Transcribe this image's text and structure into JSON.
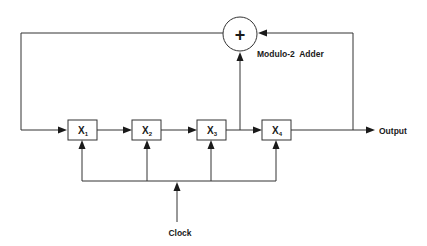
{
  "diagram": {
    "type": "linear feedback shift register",
    "registers": [
      {
        "id": "x1",
        "label": "X",
        "sub": "1"
      },
      {
        "id": "x2",
        "label": "X",
        "sub": "2"
      },
      {
        "id": "x3",
        "label": "X",
        "sub": "3"
      },
      {
        "id": "x4",
        "label": "X",
        "sub": "4"
      }
    ],
    "adder": {
      "symbol": "+",
      "label": "Modulo-2  Adder"
    },
    "output_label": "Output",
    "clock_label": "Clock",
    "colors": {
      "line": "#333333",
      "text": "#1a1a1a",
      "background": "#ffffff"
    }
  }
}
